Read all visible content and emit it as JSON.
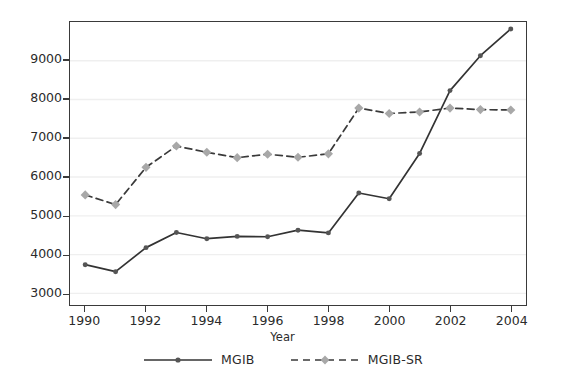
{
  "chart_data": {
    "type": "line",
    "title": "",
    "xlabel": "Year",
    "ylabel": "",
    "x": [
      1990,
      1991,
      1992,
      1993,
      1994,
      1995,
      1996,
      1997,
      1998,
      1999,
      2000,
      2001,
      2002,
      2003,
      2004
    ],
    "xlim": [
      1989.5,
      2004.5
    ],
    "ylim": [
      2700,
      10000
    ],
    "xticks": [
      1990,
      1992,
      1994,
      1996,
      1998,
      2000,
      2002,
      2004
    ],
    "xtick_labels": [
      "1990",
      "1992",
      "1994",
      "1996",
      "1998",
      "2000",
      "2002",
      "2004"
    ],
    "yticks": [
      3000,
      4000,
      5000,
      6000,
      7000,
      8000,
      9000
    ],
    "ytick_labels": [
      "3000",
      "4000",
      "5000",
      "6000",
      "7000",
      "8000",
      "9000"
    ],
    "grid": true,
    "grid_axis": "y",
    "grid_color": "#efefef",
    "legend_position": "bottom-outside",
    "series": [
      {
        "name": "MGIB",
        "line_style": "solid",
        "marker": "circle",
        "color": "#333333",
        "marker_color": "#555555",
        "values": [
          3740,
          3560,
          4180,
          4570,
          4410,
          4470,
          4460,
          4630,
          4560,
          5590,
          5440,
          6610,
          8230,
          9130,
          9820
        ]
      },
      {
        "name": "MGIB-SR",
        "line_style": "dashed",
        "marker": "diamond",
        "color": "#3a3a3a",
        "marker_color": "#a8a8a8",
        "values": [
          5540,
          5290,
          6250,
          6800,
          6640,
          6500,
          6590,
          6510,
          6600,
          7780,
          7640,
          7680,
          7780,
          7740,
          7730
        ]
      }
    ]
  },
  "legend": {
    "entries": [
      {
        "label": "MGIB"
      },
      {
        "label": "MGIB-SR"
      }
    ]
  },
  "axis": {
    "x_title": "Year"
  }
}
